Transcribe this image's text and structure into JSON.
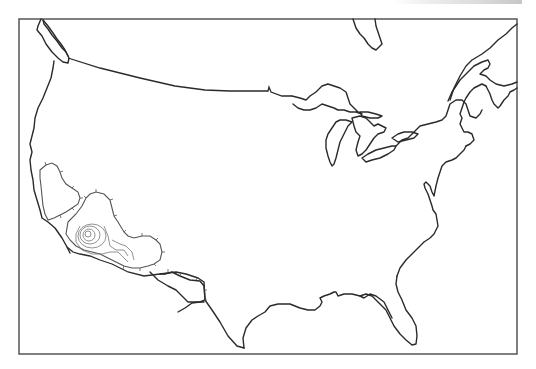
{
  "figure": {
    "type": "map",
    "region": "Contiguous United States outline with Great Lakes and southern Canada coastline",
    "frame": {
      "x": 18,
      "y": 19,
      "width": 499,
      "height": 335
    },
    "colors": {
      "line": "#2a2a2a",
      "frame": "#4a4a4a",
      "background": "#ffffff",
      "contour": "#555555"
    },
    "features": [
      {
        "name": "west-coast",
        "kind": "coastline"
      },
      {
        "name": "puget-sound-vancouver-island",
        "kind": "coastline"
      },
      {
        "name": "northern-border",
        "kind": "border"
      },
      {
        "name": "great-lakes",
        "kind": "lakes"
      },
      {
        "name": "hudson-bay-fragment",
        "kind": "coastline"
      },
      {
        "name": "gulf-of-st-lawrence",
        "kind": "coastline"
      },
      {
        "name": "east-coast",
        "kind": "coastline"
      },
      {
        "name": "florida",
        "kind": "coastline"
      },
      {
        "name": "gulf-coast",
        "kind": "coastline"
      },
      {
        "name": "mexico-border",
        "kind": "border"
      },
      {
        "name": "southwest-contours",
        "kind": "hachured-contours"
      }
    ],
    "top_fragment_text": ""
  }
}
